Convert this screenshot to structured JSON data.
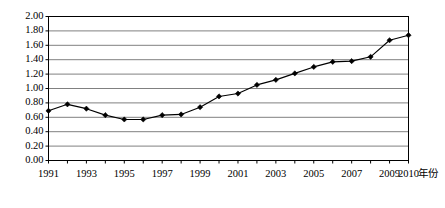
{
  "chart_data": {
    "type": "line",
    "title": "",
    "subtitle": "",
    "xlabel": "年份",
    "ylabel": "",
    "xlim": [
      1991,
      2010
    ],
    "ylim": [
      0.0,
      2.0
    ],
    "grid": true,
    "grid_axis": "y",
    "legend": false,
    "legend_position": "none",
    "marker": "diamond",
    "line_color": "#000000",
    "marker_color": "#000000",
    "grid_color": "#808080",
    "axis_color": "#000000",
    "background_color": "#ffffff",
    "x": [
      1991,
      1992,
      1993,
      1994,
      1995,
      1996,
      1997,
      1998,
      1999,
      2000,
      2001,
      2002,
      2003,
      2004,
      2005,
      2006,
      2007,
      2008,
      2009,
      2010
    ],
    "values": [
      0.69,
      0.78,
      0.72,
      0.63,
      0.57,
      0.57,
      0.63,
      0.64,
      0.74,
      0.89,
      0.93,
      1.05,
      1.12,
      1.21,
      1.3,
      1.37,
      1.38,
      1.44,
      1.67,
      1.74
    ],
    "series": [
      {
        "name": "",
        "values": [
          0.69,
          0.78,
          0.72,
          0.63,
          0.57,
          0.57,
          0.63,
          0.64,
          0.74,
          0.89,
          0.93,
          1.05,
          1.12,
          1.21,
          1.3,
          1.37,
          1.38,
          1.44,
          1.67,
          1.74
        ]
      }
    ],
    "ytick_labels": [
      "2.00",
      "1.80",
      "1.60",
      "1.40",
      "1.20",
      "1.00",
      "0.80",
      "0.60",
      "0.40",
      "0.20",
      "0.00"
    ],
    "ytick_values": [
      2.0,
      1.8,
      1.6,
      1.4,
      1.2,
      1.0,
      0.8,
      0.6,
      0.4,
      0.2,
      0.0
    ],
    "xtick_values": [
      1991,
      1992,
      1993,
      1994,
      1995,
      1996,
      1997,
      1998,
      1999,
      2000,
      2001,
      2002,
      2003,
      2004,
      2005,
      2006,
      2007,
      2008,
      2009,
      2010
    ],
    "xtick_labels": [
      "1991",
      "",
      "1993",
      "",
      "1995",
      "",
      "1997",
      "",
      "1999",
      "",
      "2001",
      "",
      "2003",
      "",
      "2005",
      "",
      "2007",
      "",
      "2009",
      "2010"
    ],
    "annotations": []
  }
}
